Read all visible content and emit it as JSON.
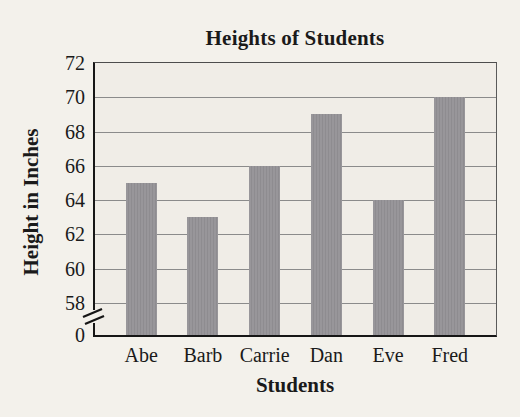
{
  "chart_data": {
    "type": "bar",
    "title": "Heights of Students",
    "xlabel": "Students",
    "ylabel": "Height in Inches",
    "categories": [
      "Abe",
      "Barb",
      "Carrie",
      "Dan",
      "Eve",
      "Fred"
    ],
    "values": [
      65,
      63,
      66,
      69,
      64,
      70
    ],
    "y_ticks": [
      0,
      58,
      60,
      62,
      64,
      66,
      68,
      70,
      72
    ],
    "y_axis_break_between": [
      0,
      58
    ],
    "ylim": [
      58,
      72
    ],
    "grid": true,
    "legend": "none",
    "bar_color": "#98969a",
    "bar_color_alt": "#8e8c90",
    "gridline_color": "#8b8b8b",
    "axis_color": "#161616",
    "page_background": "#f3f1eb",
    "plot_background": "#f0ede7"
  }
}
